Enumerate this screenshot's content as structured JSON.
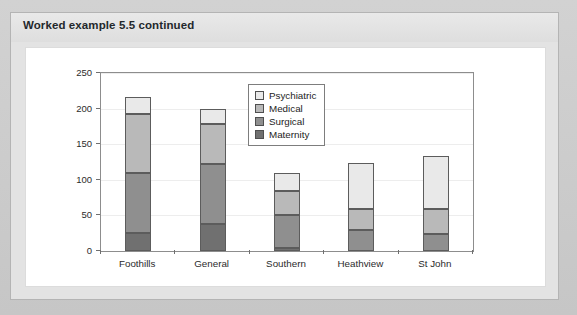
{
  "box": {
    "header_title": "Worked example 5.5 continued"
  },
  "chart_data": {
    "type": "bar",
    "stacked": true,
    "title": "",
    "xlabel": "",
    "ylabel": "",
    "ylim": [
      0,
      250
    ],
    "yticks": [
      0,
      50,
      100,
      150,
      200,
      250
    ],
    "grid": true,
    "legend_position": "top-right",
    "categories": [
      "Foothills",
      "General",
      "Southern",
      "Heathview",
      "St John"
    ],
    "series": [
      {
        "name": "Maternity",
        "color": "#707070",
        "values": [
          25,
          38,
          4,
          0,
          0
        ]
      },
      {
        "name": "Surgical",
        "color": "#8f8f8f",
        "values": [
          85,
          84,
          46,
          29,
          24
        ]
      },
      {
        "name": "Medical",
        "color": "#b9b9b9",
        "values": [
          82,
          56,
          34,
          30,
          35
        ]
      },
      {
        "name": "Psychiatric",
        "color": "#e9e9e9",
        "values": [
          25,
          21,
          26,
          65,
          75
        ]
      }
    ],
    "stack_order": [
      "Maternity",
      "Surgical",
      "Medical",
      "Psychiatric"
    ],
    "legend_entries": [
      "Psychiatric",
      "Medical",
      "Surgical",
      "Maternity"
    ],
    "totals": [
      217,
      199,
      110,
      124,
      134
    ]
  }
}
